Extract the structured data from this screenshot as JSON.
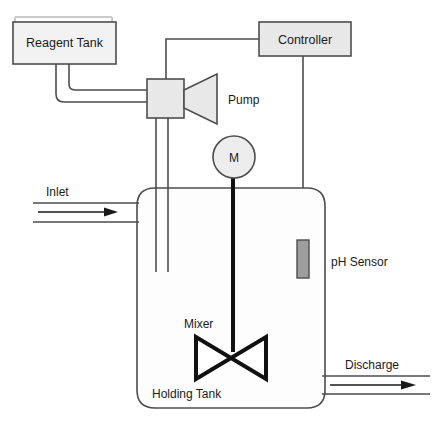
{
  "diagram": {
    "colors": {
      "stroke": "#4d4d4d",
      "box_fill": "#e8e8e8",
      "tank_fill": "#fdfdfd",
      "sensor_fill": "#9e9e9e",
      "mixer_stroke": "#111111",
      "text": "#1a1a1a",
      "background": "#ffffff"
    },
    "nodes": {
      "reagent_tank": {
        "label": "Reagent Tank",
        "x": 13,
        "y": 22,
        "w": 103,
        "h": 42
      },
      "controller": {
        "label": "Controller",
        "x": 259,
        "y": 22,
        "w": 92,
        "h": 34
      },
      "pump_body": {
        "x": 147,
        "y": 79,
        "w": 37,
        "h": 39
      },
      "pump": {
        "label": "Pump",
        "label_x": 228,
        "label_y": 104
      },
      "motor": {
        "label": "M",
        "cx": 234,
        "cy": 157,
        "r": 21
      },
      "holding_tank": {
        "label": "Holding Tank",
        "x": 137,
        "y": 188,
        "w": 188,
        "h": 220,
        "label_x": 152,
        "label_y": 398
      },
      "ph_sensor": {
        "label": "pH Sensor",
        "probe_x": 297,
        "probe_y": 240,
        "probe_w": 12,
        "probe_h": 38,
        "label_x": 331,
        "label_y": 266
      },
      "mixer": {
        "label": "Mixer",
        "label_x": 184,
        "label_y": 328,
        "cx": 231,
        "cy": 358,
        "half_w": 35,
        "half_h": 21
      }
    },
    "flows": {
      "inlet": {
        "label": "Inlet",
        "label_x": 46,
        "label_y": 196,
        "arrow_y": 212
      },
      "discharge": {
        "label": "Discharge",
        "label_x": 345,
        "label_y": 369,
        "arrow_y": 384
      }
    }
  }
}
